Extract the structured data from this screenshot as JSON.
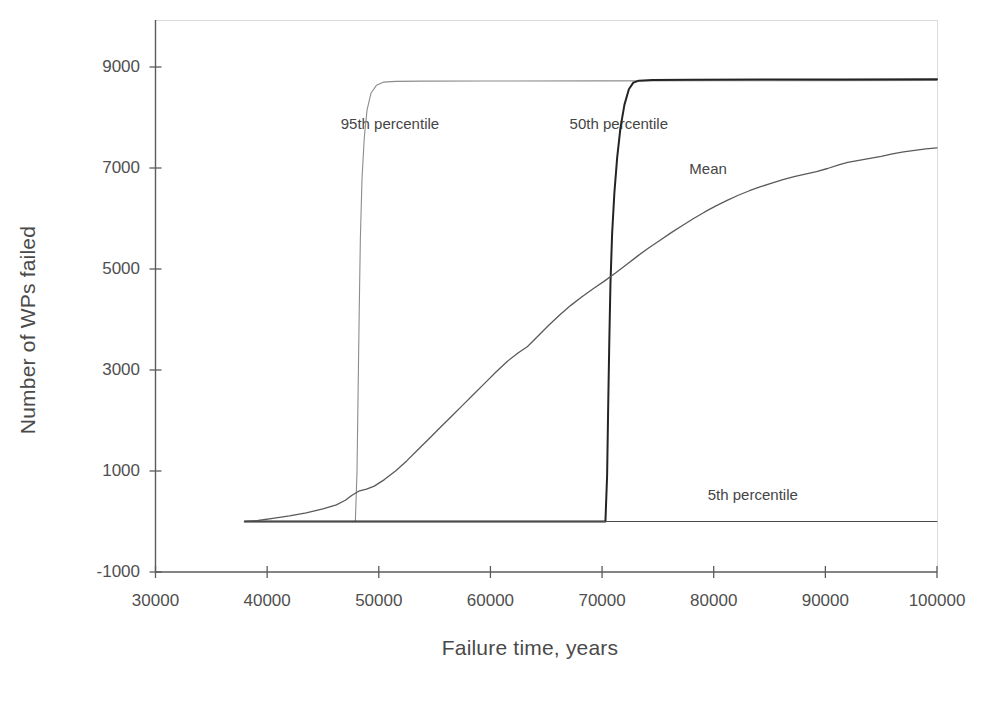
{
  "chart_data": {
    "type": "line",
    "title": "",
    "xlabel": "Failure time, years",
    "ylabel": "Number of WPs failed",
    "xlim": [
      30000,
      100000
    ],
    "ylim": [
      -1000,
      9000
    ],
    "xticks": [
      "30000",
      "40000",
      "50000",
      "60000",
      "70000",
      "80000",
      "90000",
      "100000"
    ],
    "xtick_values": [
      30000,
      40000,
      50000,
      60000,
      70000,
      80000,
      90000,
      100000
    ],
    "yticks": [
      "-1000",
      "1000",
      "3000",
      "5000",
      "7000",
      "9000"
    ],
    "ytick_values": [
      -1000,
      1000,
      3000,
      5000,
      7000,
      9000
    ],
    "grid": false,
    "legend_position": "inline-annotations",
    "annotations": [
      {
        "name": "95th percentile",
        "text": "95th percentile",
        "x": 51000,
        "y": 7900
      },
      {
        "name": "50th percentile",
        "text": "50th percentile",
        "x": 71500,
        "y": 7900
      },
      {
        "name": "Mean",
        "text": "Mean",
        "x": 79500,
        "y": 7000
      },
      {
        "name": "5th percentile",
        "text": "5th percentile",
        "x": 83500,
        "y": 550
      }
    ],
    "series": [
      {
        "name": "95th percentile",
        "color": "#8c8c8c",
        "width": 1.1,
        "points": [
          [
            38000,
            0
          ],
          [
            44000,
            0
          ],
          [
            47600,
            0
          ],
          [
            47900,
            0
          ],
          [
            48050,
            1000
          ],
          [
            48150,
            2600
          ],
          [
            48250,
            4200
          ],
          [
            48350,
            5600
          ],
          [
            48500,
            6800
          ],
          [
            48700,
            7600
          ],
          [
            48950,
            8150
          ],
          [
            49300,
            8480
          ],
          [
            49800,
            8640
          ],
          [
            50400,
            8700
          ],
          [
            51500,
            8715
          ],
          [
            54000,
            8720
          ],
          [
            60000,
            8722
          ],
          [
            70000,
            8725
          ],
          [
            80000,
            8728
          ],
          [
            90000,
            8730
          ],
          [
            100000,
            8732
          ]
        ]
      },
      {
        "name": "50th percentile",
        "color": "#242424",
        "width": 2.0,
        "points": [
          [
            38000,
            0
          ],
          [
            50000,
            0
          ],
          [
            60000,
            0
          ],
          [
            68000,
            0
          ],
          [
            70300,
            0
          ],
          [
            70450,
            900
          ],
          [
            70550,
            2300
          ],
          [
            70650,
            3600
          ],
          [
            70750,
            4700
          ],
          [
            70900,
            5700
          ],
          [
            71100,
            6500
          ],
          [
            71350,
            7200
          ],
          [
            71650,
            7800
          ],
          [
            72000,
            8250
          ],
          [
            72400,
            8560
          ],
          [
            72800,
            8690
          ],
          [
            73300,
            8730
          ],
          [
            74500,
            8745
          ],
          [
            78000,
            8750
          ],
          [
            85000,
            8752
          ],
          [
            92000,
            8754
          ],
          [
            100000,
            8756
          ]
        ]
      },
      {
        "name": "Mean",
        "color": "#5a5a5a",
        "width": 1.3,
        "points": [
          [
            38000,
            0
          ],
          [
            39200,
            20
          ],
          [
            40500,
            60
          ],
          [
            42000,
            110
          ],
          [
            43500,
            170
          ],
          [
            45000,
            250
          ],
          [
            46200,
            330
          ],
          [
            47000,
            420
          ],
          [
            47600,
            520
          ],
          [
            48200,
            600
          ],
          [
            48900,
            640
          ],
          [
            49600,
            700
          ],
          [
            50500,
            830
          ],
          [
            51500,
            1000
          ],
          [
            52500,
            1200
          ],
          [
            53500,
            1420
          ],
          [
            54500,
            1640
          ],
          [
            55500,
            1860
          ],
          [
            56500,
            2080
          ],
          [
            57500,
            2300
          ],
          [
            58500,
            2520
          ],
          [
            59500,
            2740
          ],
          [
            60500,
            2960
          ],
          [
            61500,
            3170
          ],
          [
            62500,
            3340
          ],
          [
            63300,
            3460
          ],
          [
            64200,
            3660
          ],
          [
            65200,
            3880
          ],
          [
            66200,
            4090
          ],
          [
            67200,
            4280
          ],
          [
            68200,
            4450
          ],
          [
            69200,
            4610
          ],
          [
            70200,
            4760
          ],
          [
            71200,
            4920
          ],
          [
            72200,
            5090
          ],
          [
            73200,
            5260
          ],
          [
            74200,
            5420
          ],
          [
            75200,
            5570
          ],
          [
            76200,
            5720
          ],
          [
            77200,
            5860
          ],
          [
            78200,
            6000
          ],
          [
            79200,
            6130
          ],
          [
            80200,
            6250
          ],
          [
            81200,
            6360
          ],
          [
            82200,
            6460
          ],
          [
            83200,
            6550
          ],
          [
            84200,
            6630
          ],
          [
            85200,
            6700
          ],
          [
            86200,
            6770
          ],
          [
            87200,
            6830
          ],
          [
            88200,
            6880
          ],
          [
            89200,
            6930
          ],
          [
            90200,
            6990
          ],
          [
            91200,
            7060
          ],
          [
            92000,
            7110
          ],
          [
            93000,
            7150
          ],
          [
            94000,
            7190
          ],
          [
            95000,
            7230
          ],
          [
            96000,
            7280
          ],
          [
            97000,
            7320
          ],
          [
            98000,
            7350
          ],
          [
            99000,
            7380
          ],
          [
            100000,
            7400
          ]
        ]
      },
      {
        "name": "5th percentile",
        "color": "#4a4a4a",
        "width": 1.1,
        "points": [
          [
            38000,
            0
          ],
          [
            45000,
            0
          ],
          [
            55000,
            0
          ],
          [
            65000,
            0
          ],
          [
            75000,
            0
          ],
          [
            85000,
            0
          ],
          [
            95000,
            0
          ],
          [
            100000,
            0
          ]
        ]
      }
    ]
  },
  "axes": {
    "y_axis_name": "y-axis-line",
    "x_axis_name": "x-axis-line"
  }
}
